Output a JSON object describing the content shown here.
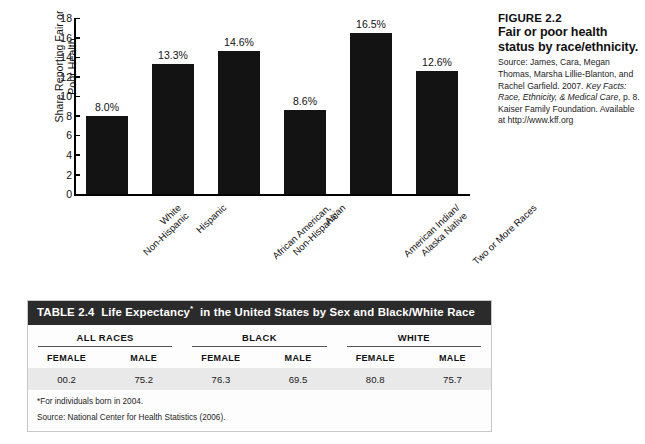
{
  "chart_data": {
    "type": "bar",
    "title": "",
    "xlabel": "",
    "ylabel": "Share Reporting Fair or Poor Health",
    "ylim": [
      0,
      18
    ],
    "ytick_step": 2,
    "yticks": [
      "18",
      "16",
      "14",
      "12",
      "10",
      "8",
      "6",
      "4",
      "2",
      "0"
    ],
    "grid": false,
    "legend": "none",
    "bar_color": "#131313",
    "categories": [
      "White\nNon-Hispanic",
      "Hispanic",
      "African American,\nNon-Hispanic",
      "Asian",
      "American Indian/\nAlaska Native",
      "Two or More Races"
    ],
    "category_lines": [
      [
        "White",
        "Non-Hispanic"
      ],
      [
        "Hispanic"
      ],
      [
        "African American,",
        "Non-Hispanic"
      ],
      [
        "Asian"
      ],
      [
        "American Indian/",
        "Alaska Native"
      ],
      [
        "Two or More Races"
      ]
    ],
    "values": [
      8.0,
      13.3,
      14.6,
      8.6,
      16.5,
      12.6
    ],
    "data_labels": [
      "8.0%",
      "13.3%",
      "14.6%",
      "8.6%",
      "16.5%",
      "12.6%"
    ]
  },
  "figure_caption": {
    "number": "FIGURE 2.2",
    "title": "Fair or poor health status by race/ethnicity.",
    "source_prefix": "Source: James, Cara, Megan Thomas, Marsha Lillie-Blanton, and Rachel Garfield. 2007. ",
    "source_italic_1": "Key Facts: Race, Ethnicity, & Medical Care",
    "source_middle": ", p. 8. Kaiser Family Foundation. Available at http://www.kff.org"
  },
  "table": {
    "title_prefix": "TABLE 2.4",
    "title_main_1": "Life Expectancy",
    "title_asterisk": "*",
    "title_main_2": "in the United States by Sex and Black/White Race",
    "groups": [
      {
        "label": "ALL RACES",
        "columns": [
          "FEMALE",
          "MALE"
        ],
        "values": [
          "00.2",
          "75.2"
        ]
      },
      {
        "label": "BLACK",
        "columns": [
          "FEMALE",
          "MALE"
        ],
        "values": [
          "76.3",
          "69.5"
        ]
      },
      {
        "label": "WHITE",
        "columns": [
          "FEMALE",
          "MALE"
        ],
        "values": [
          "80.8",
          "75.7"
        ]
      }
    ],
    "notes": [
      "*For individuals born in 2004.",
      "Source: National Center for Health Statistics (2006)."
    ]
  }
}
